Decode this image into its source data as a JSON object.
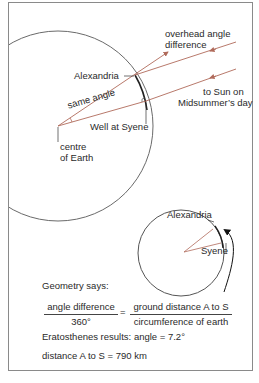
{
  "labels": {
    "overhead_angle": "overhead angle",
    "overhead_angle_2": "difference",
    "alexandria": "Alexandria",
    "same_angle": "same angle",
    "well_at_syene": "Well at Syene",
    "to_sun": "to Sun on",
    "to_sun_2": "Midsummer’s day",
    "centre": "centre",
    "centre_2": "of Earth",
    "small_alexandria": "Alexandria",
    "small_syene": "Syene"
  },
  "formula": {
    "heading": "Geometry says:",
    "left_num": "angle difference",
    "left_den": "360°",
    "equals": "=",
    "right_num": "ground distance A to S",
    "right_den": "circumference of earth",
    "result1": "Eratosthenes results: angle = 7.2°",
    "result2": "distance A to S = 790 km"
  },
  "colors": {
    "ray": "#b06a5a",
    "outline": "#555555",
    "frame": "#8a8a8a"
  }
}
